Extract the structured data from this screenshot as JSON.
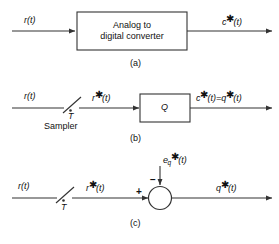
{
  "figure": {
    "background_color": "#ffffff",
    "line_color": "#333333",
    "text_color": "#111111",
    "panels": [
      {
        "caption": "(a)",
        "input_label": "r(t)",
        "output_label": "c*(t)",
        "block_line1": "Analog to",
        "block_line2": "digital converter"
      },
      {
        "caption": "(b)",
        "input_label": "r(t)",
        "sampler_label": "Sampler",
        "sampler_period": "T",
        "mid_label": "r*(t)",
        "block_label": "Q",
        "output_label": "c*(t)=q*(t)"
      },
      {
        "caption": "(c)",
        "input_label": "r(t)",
        "sampler_period": "T",
        "mid_label": "r*(t)",
        "error_input_label_base": "e",
        "error_input_label_sub": "q",
        "error_input_label_tail": "(t)",
        "summing_plus": "+",
        "summing_minus": "−",
        "output_label": "q*(t)"
      }
    ],
    "symbols": {
      "star": "✱",
      "arrow": "arrow-head",
      "sampler": "switch-slash"
    }
  }
}
